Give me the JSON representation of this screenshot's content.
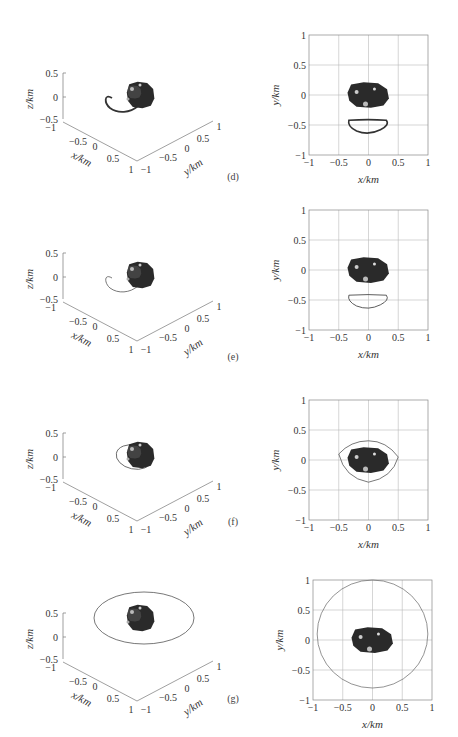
{
  "figure": {
    "panels": [
      {
        "id": "d",
        "label": "(d)",
        "orbit_2d": "crescent",
        "orbit_3d": "loop-dark"
      },
      {
        "id": "e",
        "label": "(e)",
        "orbit_2d": "crescent",
        "orbit_3d": "loop-light"
      },
      {
        "id": "f",
        "label": "(f)",
        "orbit_2d": "egg",
        "orbit_3d": "tilted"
      },
      {
        "id": "g",
        "label": "(g)",
        "orbit_2d": "circle",
        "orbit_3d": "ellipse"
      }
    ]
  },
  "axes_3d": {
    "z_label": "z/km",
    "x_label": "x/km",
    "y_label": "y/km",
    "z_ticks": [
      "0.5",
      "0",
      "−0.5"
    ],
    "x_ticks": [
      "−1",
      "−0.5",
      "0",
      "0.5",
      "1"
    ],
    "y_ticks": [
      "−1",
      "−0.5",
      "0",
      "0.5",
      "1"
    ]
  },
  "axes_2d": {
    "x_label": "x/km",
    "y_label": "y/km",
    "x_ticks": [
      "−1",
      "−0.5",
      "0",
      "0.5",
      "1"
    ],
    "y_ticks": [
      "1",
      "0.5",
      "0",
      "−0.5",
      "−1"
    ]
  },
  "chart_data": [
    {
      "type": "scatter",
      "title": "(d) 3D view",
      "xlabel": "x/km",
      "ylabel": "y/km",
      "zlabel": "z/km",
      "xlim": [
        -1,
        1
      ],
      "ylim": [
        -1,
        1
      ],
      "zlim": [
        -0.5,
        0.5
      ],
      "annotations": [
        "asteroid body",
        "teardrop-shaped orbit loop"
      ]
    },
    {
      "type": "line",
      "title": "(d) x-y projection",
      "xlabel": "x/km",
      "ylabel": "y/km",
      "xlim": [
        -1,
        1
      ],
      "ylim": [
        -1,
        1
      ],
      "grid": true,
      "series": [
        {
          "name": "orbit",
          "shape": "crescent",
          "x_range": [
            -0.35,
            0.32
          ],
          "y_range": [
            -0.65,
            -0.4
          ]
        }
      ]
    },
    {
      "type": "scatter",
      "title": "(e) 3D view",
      "xlabel": "x/km",
      "ylabel": "y/km",
      "zlabel": "z/km",
      "xlim": [
        -1,
        1
      ],
      "ylim": [
        -1,
        1
      ],
      "zlim": [
        -0.5,
        0.5
      ]
    },
    {
      "type": "line",
      "title": "(e) x-y projection",
      "xlabel": "x/km",
      "ylabel": "y/km",
      "xlim": [
        -1,
        1
      ],
      "ylim": [
        -1,
        1
      ],
      "grid": true,
      "series": [
        {
          "name": "orbit",
          "shape": "crescent",
          "x_range": [
            -0.35,
            0.32
          ],
          "y_range": [
            -0.65,
            -0.42
          ]
        }
      ]
    },
    {
      "type": "scatter",
      "title": "(f) 3D view",
      "xlabel": "x/km",
      "ylabel": "y/km",
      "zlabel": "z/km",
      "xlim": [
        -1,
        1
      ],
      "ylim": [
        -1,
        1
      ],
      "zlim": [
        -0.5,
        0.5
      ]
    },
    {
      "type": "line",
      "title": "(f) x-y projection",
      "xlabel": "x/km",
      "ylabel": "y/km",
      "xlim": [
        -1,
        1
      ],
      "ylim": [
        -1,
        1
      ],
      "grid": true,
      "series": [
        {
          "name": "orbit",
          "shape": "closed loop",
          "x_range": [
            -0.5,
            0.5
          ],
          "y_range": [
            -0.37,
            0.32
          ]
        }
      ]
    },
    {
      "type": "scatter",
      "title": "(g) 3D view",
      "xlabel": "x/km",
      "ylabel": "y/km",
      "zlabel": "z/km",
      "xlim": [
        -1,
        1
      ],
      "ylim": [
        -1,
        1
      ],
      "zlim": [
        -0.5,
        0.5
      ]
    },
    {
      "type": "line",
      "title": "(g) x-y projection",
      "xlabel": "x/km",
      "ylabel": "y/km",
      "xlim": [
        -1,
        1
      ],
      "ylim": [
        -1,
        1
      ],
      "grid": true,
      "series": [
        {
          "name": "orbit",
          "shape": "circle",
          "center": [
            0,
            0.1
          ],
          "radius": 0.9
        }
      ]
    }
  ]
}
